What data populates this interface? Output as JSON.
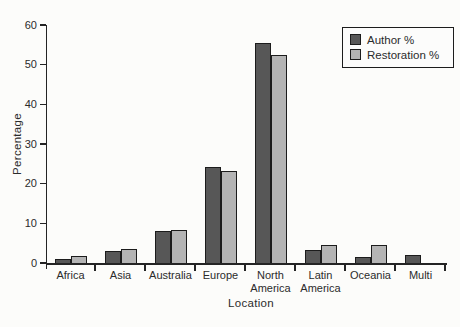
{
  "chart_data": {
    "type": "bar",
    "title": "",
    "xlabel": "Location",
    "ylabel": "Percentage",
    "ylim": [
      0,
      60
    ],
    "yticks": [
      0,
      10,
      20,
      30,
      40,
      50,
      60
    ],
    "grid": false,
    "legend_position": "top-right",
    "categories": [
      "Africa",
      "Asia",
      "Australia",
      "Europe",
      "North America",
      "Latin America",
      "Oceania",
      "Multi"
    ],
    "category_label_lines": [
      [
        "Africa"
      ],
      [
        "Asia"
      ],
      [
        "Australia"
      ],
      [
        "Europe"
      ],
      [
        "North",
        "America"
      ],
      [
        "Latin",
        "America"
      ],
      [
        "Oceania"
      ],
      [
        "Multi"
      ]
    ],
    "series": [
      {
        "name": "Author %",
        "color": "#575757",
        "values": [
          0.9,
          2.9,
          8.0,
          24.2,
          55.4,
          3.4,
          1.5,
          2.0
        ]
      },
      {
        "name": "Restoration %",
        "color": "#b4b4b4",
        "values": [
          1.8,
          3.6,
          8.4,
          23.3,
          52.4,
          4.6,
          4.6,
          0
        ]
      }
    ],
    "colors": {
      "axis": "#242424",
      "bar_border": "#1c1c1c",
      "background": "#fcfcfa"
    }
  }
}
